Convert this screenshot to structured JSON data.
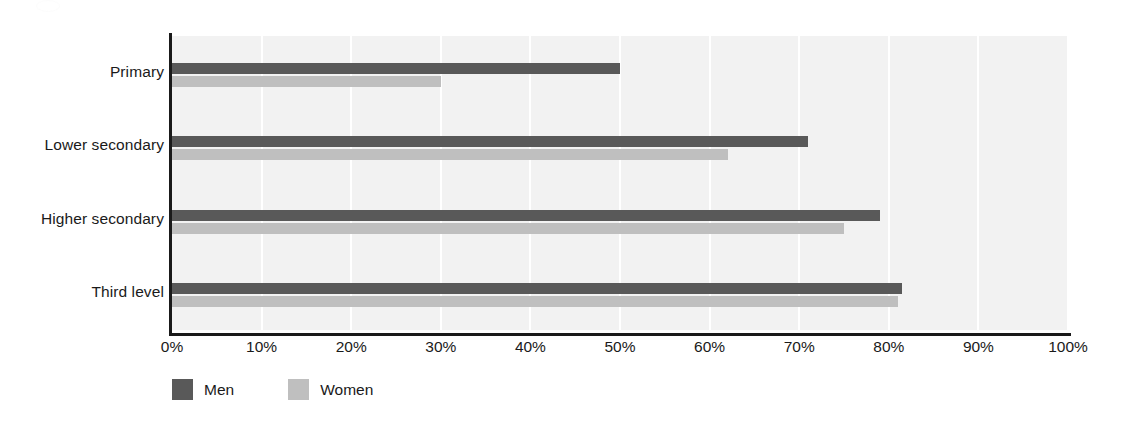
{
  "chart_data": {
    "type": "bar",
    "orientation": "horizontal",
    "title": "",
    "subtitle": "",
    "xlabel": "",
    "ylabel": "",
    "categories": [
      "Primary",
      "Lower secondary",
      "Higher secondary",
      "Third level"
    ],
    "series": [
      {
        "name": "Men",
        "color": "#595959",
        "values": [
          50,
          71,
          79,
          81.5
        ]
      },
      {
        "name": "Women",
        "color": "#bfbfbf",
        "values": [
          30,
          62,
          75,
          81
        ]
      }
    ],
    "xlim": [
      0,
      100
    ],
    "xticks": [
      0,
      10,
      20,
      30,
      40,
      50,
      60,
      70,
      80,
      90,
      100
    ],
    "xtick_labels": [
      "0%",
      "10%",
      "20%",
      "30%",
      "40%",
      "50%",
      "60%",
      "70%",
      "80%",
      "90%",
      "100%"
    ],
    "grid": "vertical",
    "gridline_color": "#ffffff",
    "plot_background": "#f2f2f2",
    "legend_position": "bottom-left",
    "annotations": []
  },
  "legend": {
    "items": [
      {
        "label": "Men",
        "color": "#595959"
      },
      {
        "label": "Women",
        "color": "#bfbfbf"
      }
    ]
  },
  "colors": {
    "men": "#595959",
    "women": "#bfbfbf",
    "axis": "#1a1a1a",
    "plot_bg": "#f2f2f2",
    "grid": "#ffffff",
    "page_bg": "#ffffff"
  }
}
